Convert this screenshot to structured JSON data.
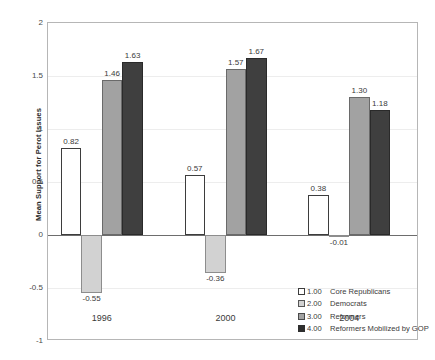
{
  "chart_data": {
    "type": "bar",
    "title": "",
    "subtitle": "",
    "xlabel": "",
    "ylabel": "Mean Support for Perot Issues",
    "categories": [
      "1996",
      "2000",
      "2004"
    ],
    "ylim": [
      -1,
      2
    ],
    "yticks": [
      "2",
      "1.5",
      "1",
      "0.5",
      "0",
      "-0.5",
      "-1"
    ],
    "ytick_values": [
      2,
      1.5,
      1,
      0.5,
      0,
      -0.5,
      -1
    ],
    "grid": true,
    "grid_axis": "y",
    "legend_position": "inside-lower-right",
    "zero_line": true,
    "series": [
      {
        "name": "Core Republicans",
        "key": "1.00",
        "color": "#ffffff",
        "edge_color": "#3d3d3d",
        "values": [
          0.82,
          0.57,
          0.38
        ],
        "labels": [
          "0.82",
          "0.57",
          "0.38"
        ]
      },
      {
        "name": "Democrats",
        "key": "2.00",
        "color": "#d2d2d2",
        "edge_color": "#8d8d8d",
        "values": [
          -0.55,
          -0.36,
          -0.01
        ],
        "labels": [
          "-0.55",
          "-0.36",
          "-0.01"
        ]
      },
      {
        "name": "Reformers",
        "key": "3.00",
        "color": "#a2a2a2",
        "edge_color": "#6a6a6a",
        "values": [
          1.46,
          1.57,
          1.3
        ],
        "labels": [
          "1.46",
          "1.57",
          "1.30"
        ]
      },
      {
        "name": "Reformers Mobilized by GOP",
        "key": "4.00",
        "color": "#3f3f3f",
        "edge_color": "#2a2a2a",
        "values": [
          1.63,
          1.67,
          1.18
        ],
        "labels": [
          "1.63",
          "1.67",
          "1.18"
        ]
      }
    ]
  },
  "axis": {
    "y_title": "Mean Support for Perot Issues",
    "y_tick_labels": [
      "2",
      "1.5",
      "1",
      "0.5",
      "0",
      "-0.5",
      "-1"
    ],
    "x_tick_labels": [
      "1996",
      "2000",
      "2004"
    ]
  },
  "legend": {
    "entries": [
      {
        "key": "1.00",
        "label": "Core Republicans"
      },
      {
        "key": "2.00",
        "label": "Democrats"
      },
      {
        "key": "3.00",
        "label": "Reformers"
      },
      {
        "key": "4.00",
        "label": "Reformers Mobilized by GOP"
      }
    ]
  }
}
